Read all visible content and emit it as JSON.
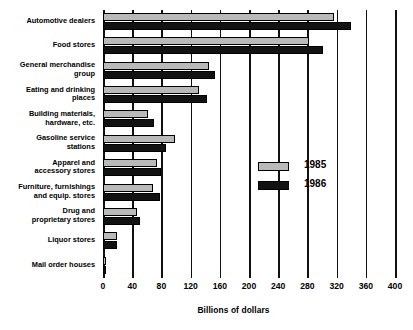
{
  "chart_data": {
    "type": "bar",
    "orientation": "horizontal",
    "title": "",
    "xlabel": "Billions of dollars",
    "ylabel": "",
    "xlim": [
      0,
      400
    ],
    "xticks": [
      0,
      40,
      80,
      120,
      160,
      200,
      240,
      280,
      320,
      360,
      400
    ],
    "grid": true,
    "legend_position": "center-right",
    "categories": [
      "Automotive dealers",
      "Food stores",
      "General merchandise group",
      "Eating and drinking places",
      "Building materials, hardware, etc.",
      "Gasoline service stations",
      "Apparel and accessory stores",
      "Furniture, furnishings and equip. stores",
      "Drug and proprietary stores",
      "Liquor stores",
      "Mail order houses"
    ],
    "category_lines": [
      [
        "Automotive dealers"
      ],
      [
        "Food stores"
      ],
      [
        "General merchandise",
        "group"
      ],
      [
        "Eating and drinking",
        "places"
      ],
      [
        "Building materials,",
        "hardware, etc."
      ],
      [
        "Gasoline service",
        "stations"
      ],
      [
        "Apparel and",
        "accessory stores"
      ],
      [
        "Furniture, furnishings",
        "and equip. stores"
      ],
      [
        "Drug and",
        "proprietary stores"
      ],
      [
        "Liquor stores"
      ],
      [
        "Mail order houses"
      ]
    ],
    "series": [
      {
        "name": "1985",
        "color": "#b9b9b9",
        "values": [
          316,
          282,
          145,
          132,
          62,
          98,
          74,
          68,
          46,
          19,
          3
        ]
      },
      {
        "name": "1986",
        "color": "#121212",
        "values": [
          340,
          302,
          153,
          142,
          70,
          86,
          80,
          78,
          51,
          19,
          3
        ]
      }
    ]
  },
  "legend": {
    "items": [
      {
        "label": "1985"
      },
      {
        "label": "1986"
      }
    ]
  }
}
